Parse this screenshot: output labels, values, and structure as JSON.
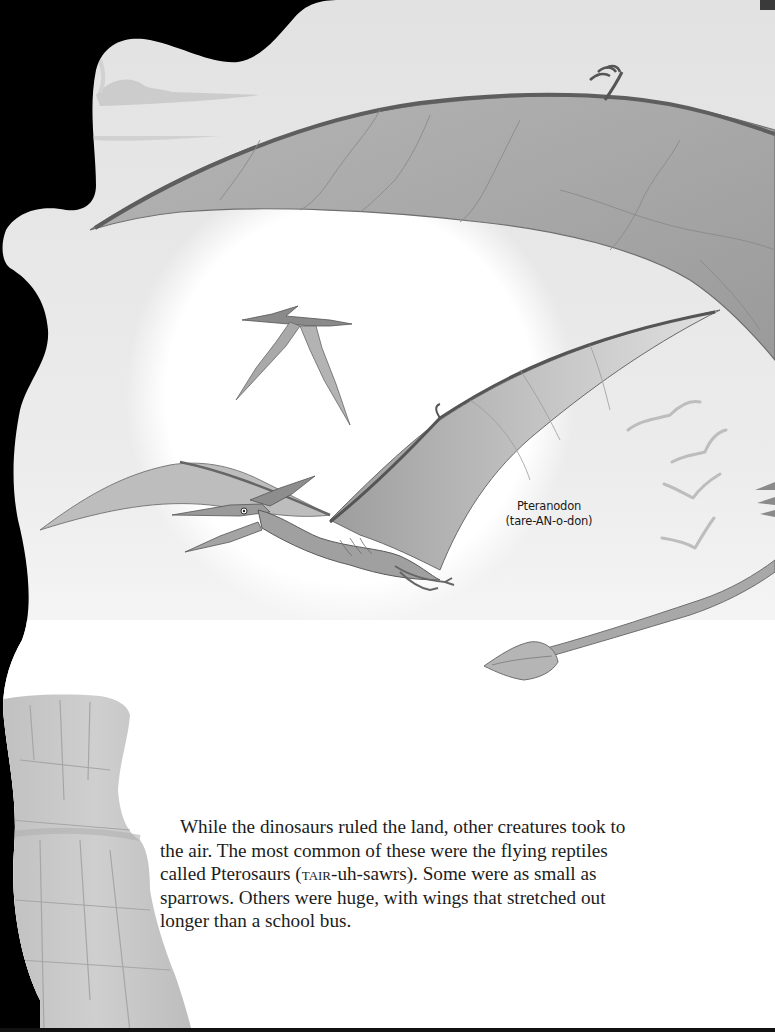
{
  "page": {
    "background_color": "#000000",
    "paper_color": "#ffffff",
    "sky_tint": "#e6e6e6",
    "ink_color": "#1c1c1c"
  },
  "illustration": {
    "subjects": [
      "large-pteranodon-wing-top",
      "distant-pteranodon",
      "main-pteranodon",
      "bird-flock",
      "pterosaur-tail",
      "rock-cliff",
      "distant-clouds",
      "sun-glow"
    ],
    "bird_count": 4
  },
  "caption": {
    "name": "Pteranodon",
    "pronunciation": "(tare-AN-o-don)"
  },
  "body": {
    "lines": {
      "l1": "While the dinosaurs ruled the land, other creatures took to",
      "l2": "the air. The most common of these were the flying reptiles",
      "l3_pre": "called Pterosaurs (",
      "l3_sc": "TAIR",
      "l3_post": "-uh-sawrs). Some were as small as",
      "l4": "sparrows. Others were huge, with wings that stretched out",
      "l5": "longer than a school bus."
    }
  }
}
